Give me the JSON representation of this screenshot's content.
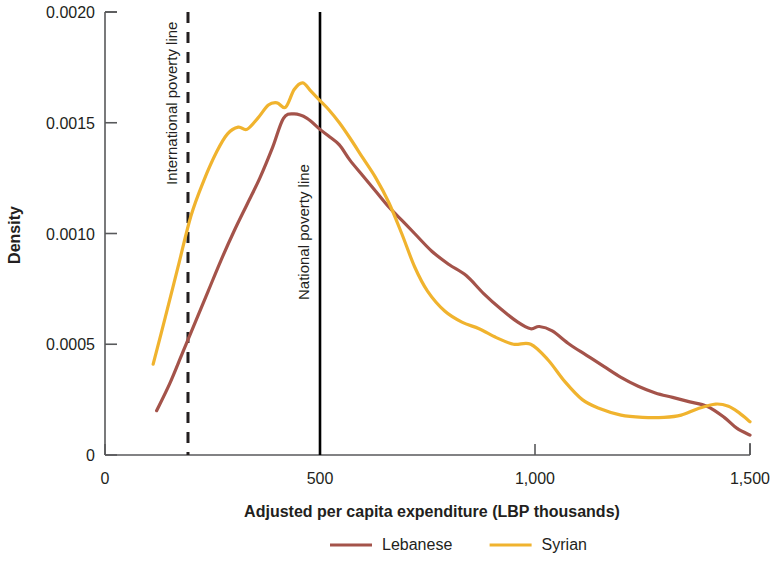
{
  "chart_data": {
    "type": "line",
    "title": "",
    "subtitle": "",
    "xlabel": "Adjusted per capita expenditure (LBP thousands)",
    "ylabel": "Density",
    "xlim": [
      0,
      1500
    ],
    "ylim": [
      0,
      0.002
    ],
    "grid": false,
    "legend_position": "bottom",
    "xticks": [
      0,
      500,
      1000,
      1500
    ],
    "xtick_labels": [
      "0",
      "500",
      "1,000",
      "1,500"
    ],
    "yticks": [
      0,
      0.0005,
      0.001,
      0.0015,
      0.002
    ],
    "ytick_labels": [
      "0",
      "0.0005",
      "0.0010",
      "0.0015",
      "0.0020"
    ],
    "series": [
      {
        "name": "Lebanese",
        "color": "#a4534a",
        "x": [
          120,
          150,
          180,
          210,
          240,
          270,
          300,
          330,
          360,
          390,
          415,
          440,
          470,
          500,
          520,
          545,
          570,
          600,
          630,
          660,
          690,
          720,
          760,
          800,
          840,
          880,
          920,
          960,
          990,
          1010,
          1040,
          1080,
          1120,
          1160,
          1200,
          1240,
          1280,
          1320,
          1360,
          1400,
          1440,
          1470,
          1500
        ],
        "y": [
          0.0002,
          0.00032,
          0.00046,
          0.0006,
          0.00074,
          0.00088,
          0.00101,
          0.00113,
          0.00125,
          0.00139,
          0.00152,
          0.00154,
          0.00152,
          0.00147,
          0.00144,
          0.0014,
          0.00133,
          0.00126,
          0.00119,
          0.00112,
          0.00106,
          0.001,
          0.00092,
          0.00086,
          0.00081,
          0.00073,
          0.00066,
          0.0006,
          0.00057,
          0.00058,
          0.00056,
          0.0005,
          0.00045,
          0.0004,
          0.00035,
          0.00031,
          0.00028,
          0.00026,
          0.00024,
          0.00022,
          0.00017,
          0.00012,
          9e-05
        ]
      },
      {
        "name": "Syrian",
        "color": "#f0b32e",
        "x": [
          112,
          140,
          170,
          200,
          230,
          260,
          285,
          310,
          330,
          355,
          380,
          400,
          420,
          440,
          460,
          480,
          500,
          520,
          545,
          570,
          600,
          630,
          660,
          690,
          720,
          750,
          790,
          830,
          870,
          910,
          950,
          990,
          1030,
          1070,
          1110,
          1150,
          1200,
          1250,
          1300,
          1340,
          1380,
          1420,
          1450,
          1475,
          1500
        ],
        "y": [
          0.00041,
          0.00062,
          0.00085,
          0.00108,
          0.00124,
          0.00137,
          0.00145,
          0.00148,
          0.00147,
          0.00152,
          0.00158,
          0.00159,
          0.00157,
          0.00165,
          0.00168,
          0.00164,
          0.0016,
          0.00156,
          0.0015,
          0.00143,
          0.00134,
          0.00125,
          0.00114,
          0.001,
          0.00085,
          0.00074,
          0.00065,
          0.0006,
          0.00057,
          0.00053,
          0.0005,
          0.0005,
          0.00043,
          0.00033,
          0.00025,
          0.00021,
          0.00018,
          0.00017,
          0.00017,
          0.00018,
          0.00021,
          0.00023,
          0.00022,
          0.00019,
          0.00015
        ]
      }
    ],
    "reference_lines": [
      {
        "name": "international-poverty-line",
        "label": "International poverty line",
        "x": 193,
        "style": "dashed",
        "color": "#231f20"
      },
      {
        "name": "national-poverty-line",
        "label": "National poverty line",
        "x": 500,
        "style": "solid",
        "color": "#000000"
      }
    ]
  },
  "legend": {
    "items": [
      {
        "label": "Lebanese",
        "color": "#a4534a"
      },
      {
        "label": "Syrian",
        "color": "#f0b32e"
      }
    ]
  },
  "axes": {
    "x_title": "Adjusted per capita expenditure (LBP thousands)",
    "y_title": "Density",
    "x_labels": [
      "0",
      "500",
      "1,000",
      "1,500"
    ],
    "y_labels": [
      "0",
      "0.0005",
      "0.0010",
      "0.0015",
      "0.0020"
    ]
  }
}
